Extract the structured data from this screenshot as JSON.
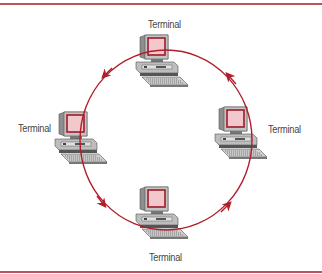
{
  "diagram": {
    "type": "ring-network",
    "flow_direction": "counterclockwise",
    "colors": {
      "ring": "#b01e2a",
      "border": "#c0505a",
      "screen_fill": "#f2c8cc",
      "screen_frame": "#a01a28",
      "computer_body": "#b8b8b8",
      "computer_dark": "#6a6a6a",
      "label_text": "#444444"
    },
    "nodes": [
      {
        "id": "top",
        "label": "Terminal"
      },
      {
        "id": "left",
        "label": "Terminal"
      },
      {
        "id": "right",
        "label": "Terminal"
      },
      {
        "id": "bottom",
        "label": "Terminal"
      }
    ]
  }
}
